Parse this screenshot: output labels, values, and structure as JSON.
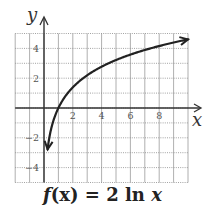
{
  "chart_data": {
    "type": "line",
    "title": "f(x) = 2 ln x",
    "xlabel": "x",
    "ylabel": "y",
    "xlim": [
      -2,
      10
    ],
    "ylim": [
      -5,
      5
    ],
    "x_ticks": [
      2,
      4,
      6,
      8
    ],
    "y_ticks": [
      -4,
      -2,
      2,
      4
    ],
    "grid": true,
    "legend": null,
    "series": [
      {
        "name": "f(x) = 2 ln x",
        "function": "2*ln(x)",
        "x": [
          0.25,
          0.5,
          1,
          2,
          3,
          4,
          5,
          6,
          7,
          8,
          9,
          10
        ],
        "y": [
          -2.77,
          -1.39,
          0,
          1.39,
          2.2,
          2.77,
          3.22,
          3.58,
          3.89,
          4.16,
          4.39,
          4.61
        ],
        "arrows": "both ends"
      }
    ],
    "color": "#222222"
  },
  "caption": {
    "prefix": "f",
    "arg": "(x)",
    "eq": " = 2 ln ",
    "var": "x"
  },
  "axes": {
    "x_label": "x",
    "y_label": "y"
  }
}
